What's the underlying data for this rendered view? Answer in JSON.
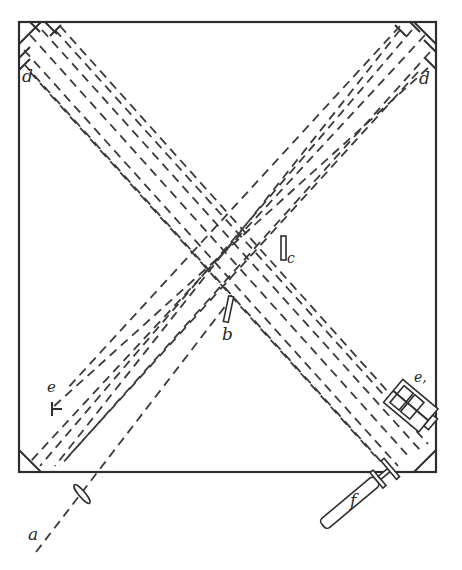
{
  "diagram": {
    "type": "optical-interferometer-schematic",
    "labels": {
      "source_beam": "a",
      "beam_splitter": "b",
      "compensator": "c",
      "end_mirrors": "d",
      "mirror_e_left": "e",
      "mirror_e_right": "e,",
      "telescope": "f"
    },
    "colors": {
      "ink": "#2e2e2e",
      "background": "#ffffff"
    },
    "frame": {
      "x": 19,
      "y": 22,
      "width": 417,
      "height": 450
    }
  }
}
